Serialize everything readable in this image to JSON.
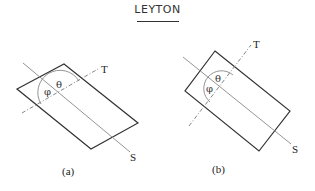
{
  "header": {
    "title": "LEYTON"
  },
  "figures": [
    {
      "caption": "(a)",
      "labels": {
        "s_axis": "S",
        "t_axis": "T",
        "theta": "θ",
        "phi": "φ"
      }
    },
    {
      "caption": "(b)",
      "labels": {
        "s_axis": "S",
        "t_axis": "T",
        "theta": "θ",
        "phi": "φ"
      }
    }
  ],
  "colors": {
    "outline": "#333333",
    "axis": "#777777"
  }
}
